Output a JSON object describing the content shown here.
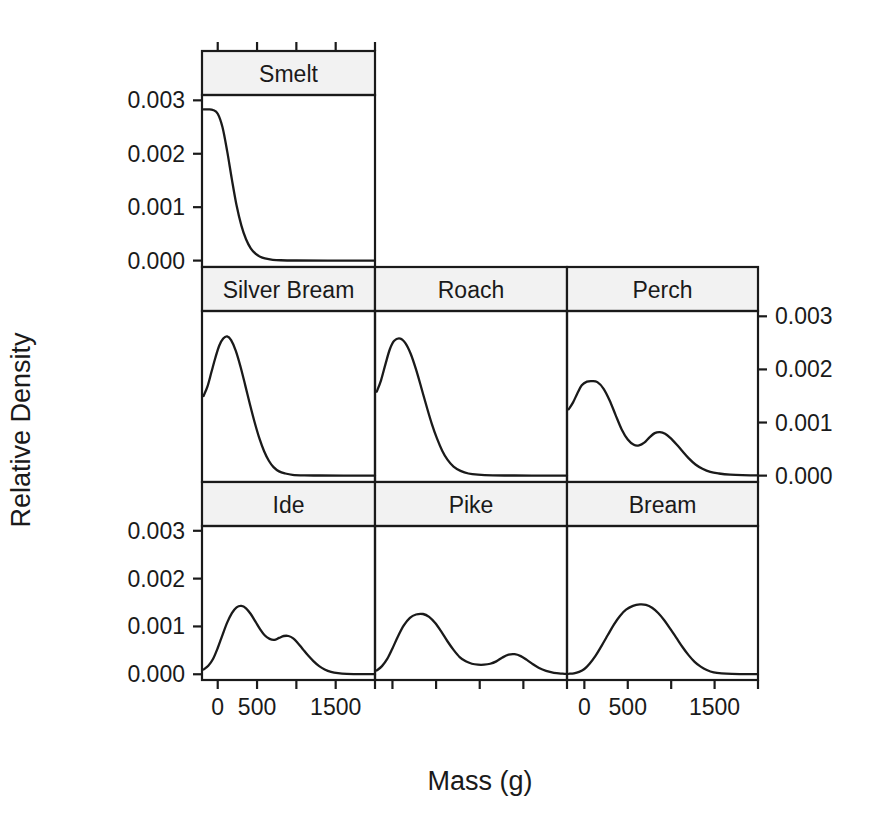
{
  "chart_data": {
    "type": "line",
    "title": "",
    "xlabel": "Mass (g)",
    "ylabel": "Relative Density",
    "layout": "trellis 3 columns x 3 rows (7 panels, top row has 1 panel)",
    "xlim": [
      -200,
      2000
    ],
    "ylim": [
      -0.00012,
      0.0031
    ],
    "xticks": [
      0,
      500,
      1000,
      1500,
      2000
    ],
    "xtick_labels": [
      "0",
      "500",
      "",
      "1500",
      ""
    ],
    "yticks": [
      0.0,
      0.001,
      0.002,
      0.003
    ],
    "ytick_labels": [
      "0.000",
      "0.001",
      "0.002",
      "0.003"
    ],
    "grid": false,
    "legend": "none",
    "y_axis_left_rows": [
      "top",
      "bottom"
    ],
    "y_axis_right_rows": [
      "middle"
    ],
    "x_axis_label_columns": [
      1,
      3
    ],
    "panels": [
      {
        "name": "Smelt",
        "row": 1,
        "col": 1,
        "peak_x": 30,
        "peak_y": 0.00283,
        "modality": "unimodal",
        "points": [
          [
            -180,
            0.00283
          ],
          [
            -120,
            0.00283
          ],
          [
            -60,
            0.00282
          ],
          [
            0,
            0.00275
          ],
          [
            60,
            0.0025
          ],
          [
            120,
            0.00205
          ],
          [
            180,
            0.00152
          ],
          [
            240,
            0.00103
          ],
          [
            300,
            0.00066
          ],
          [
            360,
            0.0004
          ],
          [
            420,
            0.00023
          ],
          [
            480,
            0.00013
          ],
          [
            540,
            7e-05
          ],
          [
            600,
            4e-05
          ],
          [
            700,
            1.5e-05
          ],
          [
            800,
            6e-06
          ],
          [
            1000,
            2e-06
          ],
          [
            1400,
            1e-06
          ],
          [
            2000,
            0.0
          ]
        ]
      },
      {
        "name": "Silver Bream",
        "row": 2,
        "col": 1,
        "peak_x": 120,
        "peak_y": 0.00262,
        "modality": "unimodal",
        "points": [
          [
            -180,
            0.0015
          ],
          [
            -130,
            0.00168
          ],
          [
            -80,
            0.00195
          ],
          [
            -30,
            0.00222
          ],
          [
            20,
            0.00245
          ],
          [
            70,
            0.00258
          ],
          [
            120,
            0.00262
          ],
          [
            170,
            0.00255
          ],
          [
            230,
            0.00235
          ],
          [
            290,
            0.00205
          ],
          [
            350,
            0.0017
          ],
          [
            410,
            0.00134
          ],
          [
            470,
            0.001
          ],
          [
            530,
            0.0007
          ],
          [
            590,
            0.00046
          ],
          [
            650,
            0.00028
          ],
          [
            710,
            0.00016
          ],
          [
            780,
            8e-05
          ],
          [
            860,
            4e-05
          ],
          [
            950,
            1.5e-05
          ],
          [
            1100,
            5e-06
          ],
          [
            1300,
            2e-06
          ],
          [
            1600,
            1e-06
          ],
          [
            2000,
            0.0
          ]
        ]
      },
      {
        "name": "Roach",
        "row": 2,
        "col": 2,
        "peak_x": 90,
        "peak_y": 0.00258,
        "modality": "unimodal",
        "points": [
          [
            -180,
            0.00158
          ],
          [
            -130,
            0.0018
          ],
          [
            -80,
            0.0021
          ],
          [
            -30,
            0.00238
          ],
          [
            20,
            0.00254
          ],
          [
            90,
            0.00258
          ],
          [
            150,
            0.00249
          ],
          [
            210,
            0.00229
          ],
          [
            270,
            0.002
          ],
          [
            330,
            0.00166
          ],
          [
            390,
            0.00131
          ],
          [
            450,
            0.00098
          ],
          [
            510,
            0.0007
          ],
          [
            570,
            0.00047
          ],
          [
            630,
            0.0003
          ],
          [
            700,
            0.00017
          ],
          [
            780,
            9e-05
          ],
          [
            870,
            4e-05
          ],
          [
            980,
            1.8e-05
          ],
          [
            1150,
            6e-06
          ],
          [
            1400,
            2e-06
          ],
          [
            1700,
            1e-06
          ],
          [
            2000,
            0.0
          ]
        ]
      },
      {
        "name": "Perch",
        "row": 2,
        "col": 3,
        "peak_x": 150,
        "peak_y": 0.00178,
        "modality": "bimodal",
        "second_peak_x": 800,
        "second_peak_y": 0.00082,
        "points": [
          [
            -180,
            0.00125
          ],
          [
            -130,
            0.00138
          ],
          [
            -80,
            0.00155
          ],
          [
            -30,
            0.0017
          ],
          [
            30,
            0.00177
          ],
          [
            90,
            0.00178
          ],
          [
            150,
            0.00176
          ],
          [
            220,
            0.00164
          ],
          [
            290,
            0.00142
          ],
          [
            360,
            0.00114
          ],
          [
            430,
            0.00087
          ],
          [
            500,
            0.00068
          ],
          [
            570,
            0.00058
          ],
          [
            630,
            0.00057
          ],
          [
            690,
            0.00062
          ],
          [
            750,
            0.00072
          ],
          [
            810,
            0.0008
          ],
          [
            870,
            0.00082
          ],
          [
            930,
            0.00079
          ],
          [
            990,
            0.00071
          ],
          [
            1060,
            0.00059
          ],
          [
            1130,
            0.00046
          ],
          [
            1200,
            0.00033
          ],
          [
            1280,
            0.00021
          ],
          [
            1360,
            0.00013
          ],
          [
            1450,
            7e-05
          ],
          [
            1550,
            4e-05
          ],
          [
            1680,
            1.8e-05
          ],
          [
            1820,
            8e-06
          ],
          [
            2000,
            3e-06
          ]
        ]
      },
      {
        "name": "Ide",
        "row": 3,
        "col": 1,
        "peak_x": 300,
        "peak_y": 0.00143,
        "modality": "bimodal",
        "second_peak_x": 850,
        "second_peak_y": 0.0008,
        "points": [
          [
            -180,
            0.0001
          ],
          [
            -120,
            0.00018
          ],
          [
            -60,
            0.00032
          ],
          [
            0,
            0.00055
          ],
          [
            60,
            0.00082
          ],
          [
            120,
            0.00108
          ],
          [
            180,
            0.00128
          ],
          [
            240,
            0.0014
          ],
          [
            300,
            0.00143
          ],
          [
            360,
            0.00138
          ],
          [
            420,
            0.00126
          ],
          [
            480,
            0.0011
          ],
          [
            540,
            0.00094
          ],
          [
            600,
            0.00081
          ],
          [
            660,
            0.00074
          ],
          [
            720,
            0.00072
          ],
          [
            780,
            0.00076
          ],
          [
            840,
            0.0008
          ],
          [
            900,
            0.0008
          ],
          [
            960,
            0.00075
          ],
          [
            1020,
            0.00065
          ],
          [
            1080,
            0.00053
          ],
          [
            1150,
            0.00039
          ],
          [
            1220,
            0.00027
          ],
          [
            1290,
            0.00017
          ],
          [
            1360,
            0.0001
          ],
          [
            1440,
            5e-05
          ],
          [
            1530,
            2.2e-05
          ],
          [
            1640,
            8e-06
          ],
          [
            1800,
            3e-06
          ],
          [
            2000,
            1e-06
          ]
        ]
      },
      {
        "name": "Pike",
        "row": 3,
        "col": 2,
        "peak_x": 350,
        "peak_y": 0.00126,
        "modality": "bimodal",
        "second_peak_x": 1380,
        "second_peak_y": 0.00042,
        "points": [
          [
            -180,
            8e-05
          ],
          [
            -120,
            0.00017
          ],
          [
            -60,
            0.00032
          ],
          [
            0,
            0.00054
          ],
          [
            60,
            0.00078
          ],
          [
            130,
            0.00102
          ],
          [
            200,
            0.00118
          ],
          [
            270,
            0.00125
          ],
          [
            350,
            0.00126
          ],
          [
            420,
            0.0012
          ],
          [
            490,
            0.00107
          ],
          [
            560,
            0.00089
          ],
          [
            630,
            0.00069
          ],
          [
            700,
            0.00051
          ],
          [
            770,
            0.00036
          ],
          [
            840,
            0.00027
          ],
          [
            910,
            0.00022
          ],
          [
            980,
            0.0002
          ],
          [
            1050,
            0.0002
          ],
          [
            1120,
            0.00022
          ],
          [
            1190,
            0.00027
          ],
          [
            1260,
            0.00035
          ],
          [
            1330,
            0.00041
          ],
          [
            1400,
            0.00042
          ],
          [
            1470,
            0.00038
          ],
          [
            1540,
            0.0003
          ],
          [
            1610,
            0.00021
          ],
          [
            1680,
            0.00013
          ],
          [
            1760,
            7e-05
          ],
          [
            1850,
            3e-05
          ],
          [
            1950,
            1.2e-05
          ],
          [
            2000,
            6e-06
          ]
        ]
      },
      {
        "name": "Bream",
        "row": 3,
        "col": 3,
        "peak_x": 700,
        "peak_y": 0.00146,
        "modality": "unimodal",
        "points": [
          [
            -180,
            1e-05
          ],
          [
            -120,
            2e-05
          ],
          [
            -60,
            5e-05
          ],
          [
            0,
            0.00011
          ],
          [
            60,
            0.00022
          ],
          [
            130,
            0.00039
          ],
          [
            200,
            0.0006
          ],
          [
            270,
            0.00082
          ],
          [
            340,
            0.00104
          ],
          [
            410,
            0.00122
          ],
          [
            480,
            0.00135
          ],
          [
            560,
            0.00143
          ],
          [
            640,
            0.00146
          ],
          [
            710,
            0.00145
          ],
          [
            780,
            0.00139
          ],
          [
            850,
            0.00128
          ],
          [
            920,
            0.00113
          ],
          [
            990,
            0.00095
          ],
          [
            1060,
            0.00076
          ],
          [
            1130,
            0.00057
          ],
          [
            1200,
            0.0004
          ],
          [
            1270,
            0.00026
          ],
          [
            1340,
            0.00016
          ],
          [
            1410,
            9e-05
          ],
          [
            1490,
            4e-05
          ],
          [
            1580,
            1.8e-05
          ],
          [
            1700,
            6e-06
          ],
          [
            1850,
            2e-06
          ],
          [
            2000,
            1e-06
          ]
        ]
      }
    ]
  },
  "axes": {
    "y_label": "Relative Density",
    "x_label": "Mass (g)",
    "y_tick_labels": [
      "0.000",
      "0.001",
      "0.002",
      "0.003"
    ],
    "x_tick_labels": [
      "0",
      "500",
      "1500"
    ]
  },
  "strips": {
    "smelt": "Smelt",
    "silver_bream": "Silver Bream",
    "roach": "Roach",
    "perch": "Perch",
    "ide": "Ide",
    "pike": "Pike",
    "bream": "Bream"
  },
  "colors": {
    "line": "#1a1a1a",
    "frame": "#1a1a1a",
    "strip_fill": "#f2f2f2",
    "background": "#ffffff"
  }
}
